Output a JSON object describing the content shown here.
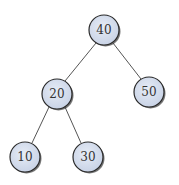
{
  "diagram": {
    "type": "binary-tree",
    "colors": {
      "node_fill": "#d8e0ee",
      "node_border": "#2a2a2a",
      "edge": "#555555",
      "text": "#333333"
    },
    "nodes": [
      {
        "id": "n40",
        "label": "40",
        "cx": 104,
        "cy": 30
      },
      {
        "id": "n20",
        "label": "20",
        "cx": 57,
        "cy": 94
      },
      {
        "id": "n50",
        "label": "50",
        "cx": 149,
        "cy": 92
      },
      {
        "id": "n10",
        "label": "10",
        "cx": 25,
        "cy": 157
      },
      {
        "id": "n30",
        "label": "30",
        "cx": 88,
        "cy": 157
      }
    ],
    "edges": [
      {
        "from": "40",
        "to": "20"
      },
      {
        "from": "40",
        "to": "50"
      },
      {
        "from": "20",
        "to": "10"
      },
      {
        "from": "20",
        "to": "30"
      }
    ]
  }
}
